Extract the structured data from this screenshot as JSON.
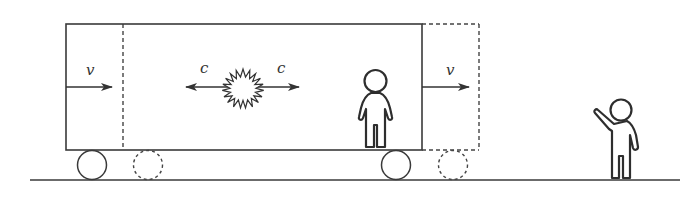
{
  "diagram": {
    "labels": {
      "velocity_left": "v",
      "velocity_right": "v",
      "light_left": "c",
      "light_right": "c"
    },
    "elements": [
      "train-car (solid outline, current position)",
      "train-car (dashed outline, displaced position)",
      "light-flash starburst at center",
      "observer inside car at right",
      "observer on ground waving",
      "ground line"
    ],
    "colors": {
      "stroke": "#3a3a3a",
      "background": "#ffffff"
    }
  }
}
